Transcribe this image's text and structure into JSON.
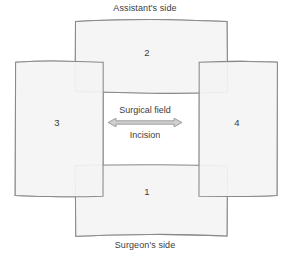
{
  "figure": {
    "title_top": "Assistant's side",
    "title_bottom": "Surgeon's side"
  },
  "drapes": [
    {
      "id": "1",
      "number": "1",
      "position": "bottom"
    },
    {
      "id": "2",
      "number": "2",
      "position": "top"
    },
    {
      "id": "3",
      "number": "3",
      "position": "left"
    },
    {
      "id": "4",
      "number": "4",
      "position": "right"
    }
  ],
  "field": {
    "upper_label": "Surgical field",
    "lower_label": "Incision",
    "arrow": "double-headed-horizontal-arrow"
  },
  "colors": {
    "drape_fill": "#f4f4f4",
    "drape_stroke": "#8a8a8a",
    "overlap_fill": "#d9d9d9",
    "field_fill": "#ffffff",
    "arrow_fill": "#cfcfcf",
    "arrow_stroke": "#8d8d8d",
    "text": "#3c3c3c",
    "background": "#ffffff"
  }
}
